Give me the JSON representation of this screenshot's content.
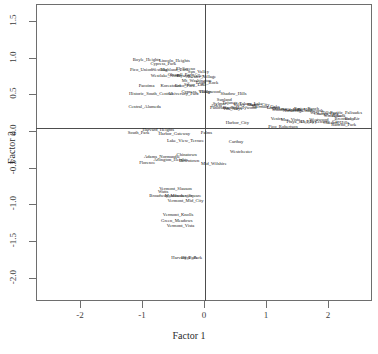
{
  "chart_data": {
    "type": "scatter",
    "title": "",
    "xlabel": "Factor 1",
    "ylabel": "Factor 2",
    "xlim": [
      -2.72,
      2.72
    ],
    "ylim": [
      -2.32,
      1.73
    ],
    "grid": false,
    "legend": null,
    "xticks": [
      "-2",
      "-1",
      "0",
      "1",
      "2"
    ],
    "xtick_values": [
      -2,
      -1,
      0,
      1,
      2
    ],
    "yticks": [
      "1.5",
      "1.0",
      "0.5",
      "0.0",
      "-0.5",
      "-1.0",
      "-1.5",
      "-2.0"
    ],
    "ytick_values": [
      1.5,
      1.0,
      0.5,
      0.0,
      -0.5,
      -1.0,
      -1.5,
      -2.0
    ],
    "reference_lines": {
      "vertical_x": 0,
      "horizontal_y": 0
    },
    "point_label_mode": "text",
    "points": [
      {
        "label": "Boyle_Heights",
        "x": -0.93,
        "y": 0.98
      },
      {
        "label": "Cypress_Park",
        "x": -0.66,
        "y": 0.92
      },
      {
        "label": "Lincoln_Heights",
        "x": -0.48,
        "y": 0.96
      },
      {
        "label": "Pico_Union",
        "x": -1.02,
        "y": 0.84
      },
      {
        "label": "Westlake",
        "x": -0.72,
        "y": 0.84
      },
      {
        "label": "Highland_Park",
        "x": -0.48,
        "y": 0.84
      },
      {
        "label": "El_Sereno",
        "x": -0.3,
        "y": 0.86
      },
      {
        "label": "Sun_Valley",
        "x": -0.09,
        "y": 0.82
      },
      {
        "label": "Westlake_North",
        "x": -0.62,
        "y": 0.76
      },
      {
        "label": "Glassell_Park",
        "x": -0.38,
        "y": 0.78
      },
      {
        "label": "Elysian_Valley",
        "x": -0.22,
        "y": 0.76
      },
      {
        "label": "Atwater_Village",
        "x": -0.05,
        "y": 0.75
      },
      {
        "label": "Mt_Washington",
        "x": -0.12,
        "y": 0.7
      },
      {
        "label": "Pacoima",
        "x": -0.93,
        "y": 0.62
      },
      {
        "label": "Koreatown",
        "x": -0.54,
        "y": 0.62
      },
      {
        "label": "Echo_Park",
        "x": -0.31,
        "y": 0.63
      },
      {
        "label": "Silver_Lake",
        "x": -0.14,
        "y": 0.64
      },
      {
        "label": "Eagle_Rock",
        "x": 0.05,
        "y": 0.66
      },
      {
        "label": "Historic_South_Central",
        "x": -0.86,
        "y": 0.52
      },
      {
        "label": "University_Park",
        "x": -0.33,
        "y": 0.52
      },
      {
        "label": "Cypress_Village",
        "x": -0.12,
        "y": 0.54
      },
      {
        "label": "Hollywood",
        "x": 0.1,
        "y": 0.55
      },
      {
        "label": "Shadow_Hills",
        "x": 0.48,
        "y": 0.52
      },
      {
        "label": "Sunland",
        "x": 0.33,
        "y": 0.44
      },
      {
        "label": "Tujunga",
        "x": 0.42,
        "y": 0.4
      },
      {
        "label": "Sylmar",
        "x": 0.25,
        "y": 0.38
      },
      {
        "label": "Arleta",
        "x": 0.2,
        "y": 0.35
      },
      {
        "label": "Panorama_City",
        "x": 0.33,
        "y": 0.33
      },
      {
        "label": "Van_Nuys",
        "x": 0.46,
        "y": 0.31
      },
      {
        "label": "North_Hollywood",
        "x": 0.58,
        "y": 0.33
      },
      {
        "label": "Valley_Glen",
        "x": 0.66,
        "y": 0.36
      },
      {
        "label": "Toluca_Lake",
        "x": 0.76,
        "y": 0.38
      },
      {
        "label": "Studio_City",
        "x": 0.88,
        "y": 0.36
      },
      {
        "label": "Sherman_Oaks",
        "x": 1.0,
        "y": 0.34
      },
      {
        "label": "Encino",
        "x": 1.12,
        "y": 0.33
      },
      {
        "label": "Tarzana",
        "x": 1.22,
        "y": 0.31
      },
      {
        "label": "Woodland_Hills",
        "x": 1.34,
        "y": 0.3
      },
      {
        "label": "Northridge",
        "x": 1.44,
        "y": 0.28
      },
      {
        "label": "Granada_Hills",
        "x": 1.54,
        "y": 0.3
      },
      {
        "label": "Porter_Ranch",
        "x": 1.66,
        "y": 0.31
      },
      {
        "label": "Chatsworth",
        "x": 1.76,
        "y": 0.28
      },
      {
        "label": "West_Hills",
        "x": 1.88,
        "y": 0.26
      },
      {
        "label": "Canoga_Park",
        "x": 1.98,
        "y": 0.24
      },
      {
        "label": "Winnetka",
        "x": 2.08,
        "y": 0.22
      },
      {
        "label": "Reseda",
        "x": 2.18,
        "y": 0.22
      },
      {
        "label": "Pacific_Palisades",
        "x": 2.3,
        "y": 0.26
      },
      {
        "label": "Brentwood",
        "x": 2.28,
        "y": 0.18
      },
      {
        "label": "Bel_Air",
        "x": 2.4,
        "y": 0.18
      },
      {
        "label": "Venice",
        "x": 1.18,
        "y": 0.18
      },
      {
        "label": "Mar_Vista",
        "x": 1.4,
        "y": 0.16
      },
      {
        "label": "Playa_del_Rey",
        "x": 1.56,
        "y": 0.14
      },
      {
        "label": "Del_Rey",
        "x": 1.7,
        "y": 0.14
      },
      {
        "label": "Westwood",
        "x": 1.86,
        "y": 0.16
      },
      {
        "label": "Century_City",
        "x": 2.0,
        "y": 0.14
      },
      {
        "label": "Cheviot_Hills",
        "x": 2.14,
        "y": 0.12
      },
      {
        "label": "Rancho_Park",
        "x": 2.26,
        "y": 0.1
      },
      {
        "label": "Central_Alameda",
        "x": -0.96,
        "y": 0.34
      },
      {
        "label": "Harbor_City",
        "x": 0.54,
        "y": 0.12
      },
      {
        "label": "Pico_Robertson",
        "x": 1.28,
        "y": 0.06
      },
      {
        "label": "Harvard_Heights",
        "x": -0.74,
        "y": 0.03
      },
      {
        "label": "South_Park",
        "x": -1.06,
        "y": -0.02
      },
      {
        "label": "Harbor_Gateway",
        "x": -0.48,
        "y": -0.03
      },
      {
        "label": "Palms",
        "x": 0.04,
        "y": -0.02
      },
      {
        "label": "Lake_View_Terrace",
        "x": -0.3,
        "y": -0.12
      },
      {
        "label": "Carthay",
        "x": 0.52,
        "y": -0.14
      },
      {
        "label": "Westchester",
        "x": 0.6,
        "y": -0.28
      },
      {
        "label": "Adams_Normandie",
        "x": -0.68,
        "y": -0.34
      },
      {
        "label": "Chinatown",
        "x": -0.28,
        "y": -0.31
      },
      {
        "label": "Arlington_Heights",
        "x": -0.54,
        "y": -0.38
      },
      {
        "label": "Downtown",
        "x": -0.24,
        "y": -0.4
      },
      {
        "label": "Mid_Wilshire",
        "x": 0.16,
        "y": -0.44
      },
      {
        "label": "Florence",
        "x": -0.92,
        "y": -0.42
      },
      {
        "label": "Vermont_Slauson",
        "x": -0.46,
        "y": -0.78
      },
      {
        "label": "Watts",
        "x": -0.66,
        "y": -0.82
      },
      {
        "label": "Broadway_Manchester",
        "x": -0.54,
        "y": -0.88
      },
      {
        "label": "Manchester_Square",
        "x": -0.34,
        "y": -0.88
      },
      {
        "label": "Vermont_Mid_City",
        "x": -0.3,
        "y": -0.94
      },
      {
        "label": "Vermont_Knolls",
        "x": -0.42,
        "y": -1.14
      },
      {
        "label": "Green_Meadows",
        "x": -0.44,
        "y": -1.22
      },
      {
        "label": "Vermont_Vista",
        "x": -0.38,
        "y": -1.28
      },
      {
        "label": "Harvard_Park",
        "x": -0.32,
        "y": -1.72
      },
      {
        "label": "Hyde_Park",
        "x": -0.2,
        "y": -1.72
      }
    ]
  }
}
